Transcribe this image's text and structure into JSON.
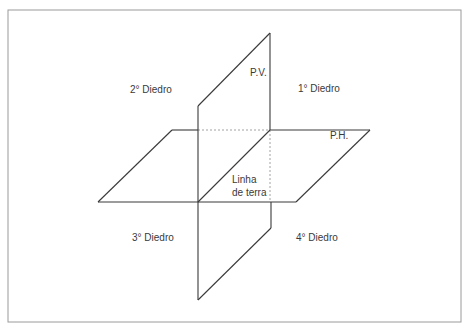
{
  "diagram": {
    "labels": {
      "vertical_plane": "P.V.",
      "horizontal_plane": "P.H.",
      "ground_line_1": "Linha",
      "ground_line_2": "de terra",
      "dihedral_1": "1° Diedro",
      "dihedral_2": "2° Diedro",
      "dihedral_3": "3° Diedro",
      "dihedral_4": "4° Diedro"
    },
    "colors": {
      "line": "#3a3a3a",
      "frame": "#9a9a9a",
      "dashed": "#8a8a8a",
      "text": "#3a3a3a",
      "background": "#ffffff"
    }
  }
}
